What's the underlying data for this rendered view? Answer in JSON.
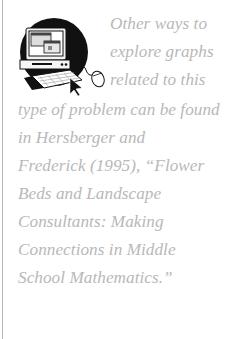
{
  "sidebar_note": {
    "icon": "computer-mouse-icon",
    "lines": [
      "Other ways to",
      "explore graphs",
      "related to this",
      "type of problem can be found",
      "in Hersberger and",
      "Frederick (1995), “Flower",
      "Beds and Landscape",
      "Consultants: Making",
      "Connections in Middle",
      "School Mathematics.”"
    ]
  },
  "colors": {
    "text": "#b8b8b8",
    "rule": "#b9b9b9",
    "icon": "#111111"
  }
}
